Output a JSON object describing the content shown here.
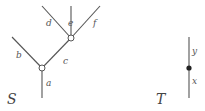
{
  "tree_S": {
    "name": "S",
    "edges": {
      "a": "a",
      "b": "b",
      "c": "c",
      "d": "d",
      "e": "e",
      "f": "f"
    }
  },
  "tree_T": {
    "name": "T",
    "edges": {
      "x": "x",
      "y": "y"
    }
  },
  "colors": {
    "line": "#555555",
    "node_fill": "#ffffff",
    "dot": "#222222"
  }
}
